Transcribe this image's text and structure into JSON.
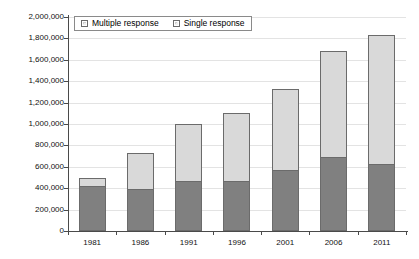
{
  "chart_data": {
    "type": "bar",
    "title": "",
    "subtitle": "",
    "xlabel": "",
    "ylabel": "",
    "stacked": true,
    "grid": true,
    "legend_position": "top-left",
    "ylim": [
      0,
      2000000
    ],
    "ytick_step": 200000,
    "categories": [
      "1981",
      "1986",
      "1991",
      "1996",
      "2001",
      "2006",
      "2011"
    ],
    "ytick_labels": [
      "0",
      "200,000",
      "400,000",
      "600,000",
      "800,000",
      "1,000,000",
      "1,200,000",
      "1,400,000",
      "1,600,000",
      "1,800,000",
      "2,000,000"
    ],
    "series": [
      {
        "name": "Multiple response",
        "color": "#808080",
        "values": [
          420000,
          395000,
          465000,
          470000,
          570000,
          695000,
          625000
        ]
      },
      {
        "name": "Single response",
        "color": "#d9d9d9",
        "values": [
          75000,
          335000,
          535000,
          635000,
          760000,
          990000,
          1205000
        ]
      }
    ],
    "totals": [
      495000,
      730000,
      1000000,
      1105000,
      1330000,
      1685000,
      1830000
    ]
  },
  "legend": {
    "items": [
      {
        "label": "Multiple response"
      },
      {
        "label": "Single response"
      }
    ]
  }
}
